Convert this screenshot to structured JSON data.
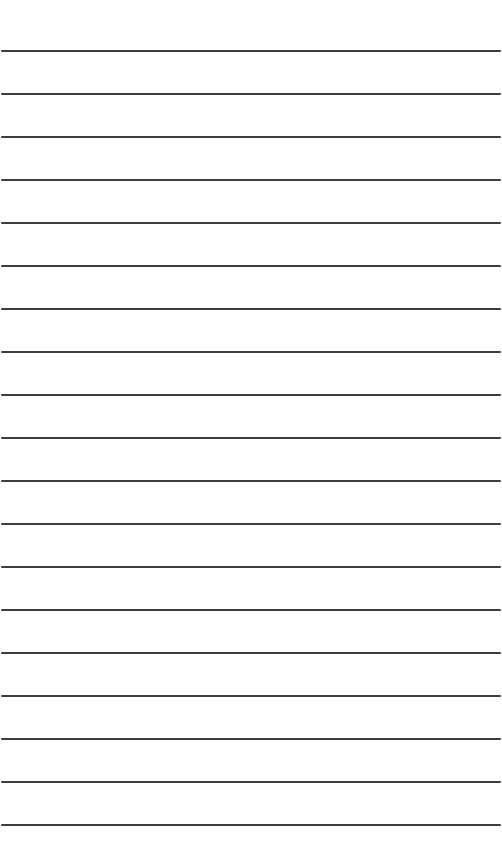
{
  "sheet": {
    "type": "lined-paper",
    "background": "#ffffff",
    "line_color": "#2e2e2e",
    "line_count": 19,
    "first_line_y": 50,
    "line_spacing": 43,
    "line_thickness": 2
  }
}
